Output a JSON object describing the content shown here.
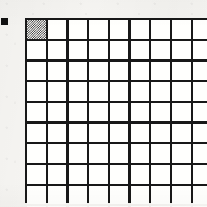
{
  "figure": {
    "kind": "grid-diagram",
    "background_color": "#f7f6f3",
    "ink_color": "#1c1c1c",
    "alt_caption": ""
  },
  "marker": {
    "name": "bullet-marker",
    "shape": "solid-square",
    "color": "#151515",
    "size_px": 7
  },
  "grid": {
    "columns": 10,
    "rows": 10,
    "cell_size_px": 18.5,
    "line_width_px": 2.2,
    "line_color": "#1c1c1c",
    "cell_fill_color": "#fbfaf8",
    "clipped_right_edge": true,
    "filled_cells": [
      {
        "row": 1,
        "col": 1,
        "pattern": "50-percent-checkerboard",
        "pattern_color": "#2a2a2a"
      }
    ]
  },
  "chart_data": {
    "type": "heatmap",
    "title": "",
    "xlabel": "",
    "ylabel": "",
    "grid": true,
    "legend": "none",
    "columns": 10,
    "rows": 10,
    "values": [
      [
        1,
        0,
        0,
        0,
        0,
        0,
        0,
        0,
        0,
        0
      ],
      [
        0,
        0,
        0,
        0,
        0,
        0,
        0,
        0,
        0,
        0
      ],
      [
        0,
        0,
        0,
        0,
        0,
        0,
        0,
        0,
        0,
        0
      ],
      [
        0,
        0,
        0,
        0,
        0,
        0,
        0,
        0,
        0,
        0
      ],
      [
        0,
        0,
        0,
        0,
        0,
        0,
        0,
        0,
        0,
        0
      ],
      [
        0,
        0,
        0,
        0,
        0,
        0,
        0,
        0,
        0,
        0
      ],
      [
        0,
        0,
        0,
        0,
        0,
        0,
        0,
        0,
        0,
        0
      ],
      [
        0,
        0,
        0,
        0,
        0,
        0,
        0,
        0,
        0,
        0
      ],
      [
        0,
        0,
        0,
        0,
        0,
        0,
        0,
        0,
        0,
        0
      ],
      [
        0,
        0,
        0,
        0,
        0,
        0,
        0,
        0,
        0,
        0
      ]
    ]
  }
}
